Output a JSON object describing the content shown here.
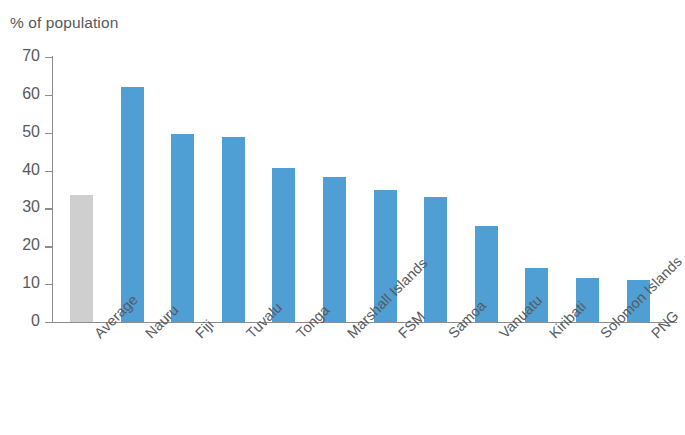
{
  "chart_data": {
    "type": "bar",
    "title": "% of population",
    "xlabel": "",
    "ylabel": "% of population",
    "ylim": [
      0,
      70
    ],
    "ytick_step": 10,
    "yticks": [
      70,
      60,
      50,
      40,
      30,
      20,
      10,
      0
    ],
    "grid": false,
    "legend": false,
    "legend_position": "none",
    "categories": [
      "Average",
      "Nauru",
      "Fiji",
      "Tuvalu",
      "Tonga",
      "Marshall Islands",
      "FSM",
      "Samoa",
      "Vanuatu",
      "Kiribati",
      "Solomon Islands",
      "PNG"
    ],
    "values": [
      33.5,
      62.0,
      49.6,
      49.0,
      40.8,
      38.2,
      34.8,
      33.0,
      25.4,
      14.3,
      11.7,
      11.0
    ],
    "bar_colors": [
      "#cfcfcf",
      "#4f9fd4",
      "#4f9fd4",
      "#4f9fd4",
      "#4f9fd4",
      "#4f9fd4",
      "#4f9fd4",
      "#4f9fd4",
      "#4f9fd4",
      "#4f9fd4",
      "#4f9fd4",
      "#4f9fd4"
    ],
    "series": [
      {
        "name": "% of population",
        "values": [
          33.5,
          62.0,
          49.6,
          49.0,
          40.8,
          38.2,
          34.8,
          33.0,
          25.4,
          14.3,
          11.7,
          11.0
        ]
      }
    ],
    "accent_color": "#4f9fd4",
    "highlight_color": "#cfcfcf",
    "axis_color": "#8c8c8c",
    "text_color": "#58595b"
  }
}
